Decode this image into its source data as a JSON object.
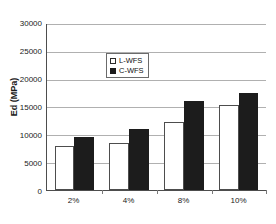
{
  "chart_data": {
    "type": "bar",
    "title": "",
    "xlabel": "",
    "ylabel": "Ed (MPa)",
    "categories": [
      "2%",
      "4%",
      "8%",
      "10%"
    ],
    "series": [
      {
        "name": "L-WFS",
        "color": "#ffffff",
        "values": [
          7950,
          8450,
          12250,
          15450
        ]
      },
      {
        "name": "C-WFS",
        "color": "#1c1c1c",
        "values": [
          9550,
          11100,
          16150,
          17600
        ]
      }
    ],
    "ylim": [
      0,
      30000
    ],
    "ytick_values": [
      0,
      5000,
      10000,
      15000,
      20000,
      25000,
      30000
    ],
    "ytick_labels": [
      "0",
      "5000",
      "10000",
      "15000",
      "20000",
      "25000",
      "30000"
    ],
    "grid": "horizontal",
    "legend_position": "top-left",
    "legend": [
      {
        "label": "L-WFS",
        "marker": "open-square"
      },
      {
        "label": "C-WFS",
        "marker": "filled-square"
      }
    ]
  }
}
